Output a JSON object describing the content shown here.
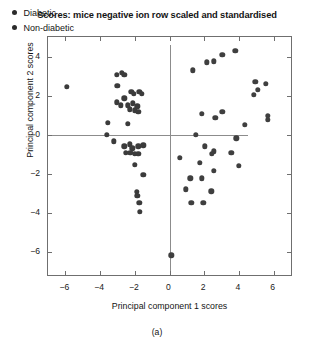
{
  "chart_data": {
    "type": "scatter",
    "title": "Scores: mice negative ion row scaled and standardised",
    "xlabel": "Principal component 1 scores",
    "ylabel": "Principal component 2 scores",
    "caption": "(a)",
    "xlim": [
      -7.0,
      7.0
    ],
    "ylim": [
      -7.2,
      5.0
    ],
    "xticks": [
      -6,
      -4,
      -2,
      0,
      2,
      4,
      6
    ],
    "xticklabels": [
      "−6",
      "−4",
      "−2",
      "0",
      "2",
      "4",
      "6"
    ],
    "yticks": [
      4,
      2,
      0,
      -2,
      -4,
      -6
    ],
    "yticklabels": [
      "4",
      "2",
      "0",
      "−2",
      "−4",
      "−6"
    ],
    "grid": false,
    "reference_lines": {
      "horizontal_y": 0,
      "vertical_x": 0,
      "color": "#8c8c8c"
    },
    "legend": {
      "position": "upper-left",
      "entries": [
        {
          "label": "Diabetic",
          "marker": "filled-circle",
          "color": "#2b2b2b"
        },
        {
          "label": "Non-diabetic",
          "marker": "filled-circle",
          "color": "#2b2b2b"
        }
      ]
    },
    "series": [
      {
        "name": "Diabetic",
        "color": "#3b3b3b",
        "marker": "filled-circle",
        "points": [
          [
            -5.9,
            2.45
          ],
          [
            -3.05,
            3.05
          ],
          [
            -2.75,
            3.15
          ],
          [
            -2.6,
            3.05
          ],
          [
            -3.0,
            2.5
          ],
          [
            -2.2,
            2.2
          ],
          [
            -2.05,
            2.1
          ],
          [
            -1.75,
            2.2
          ],
          [
            -1.6,
            2.1
          ],
          [
            -3.05,
            1.65
          ],
          [
            -2.8,
            1.5
          ],
          [
            -2.6,
            1.85
          ],
          [
            -2.4,
            1.5
          ],
          [
            -2.3,
            1.3
          ],
          [
            -2.1,
            1.6
          ],
          [
            -2.0,
            1.25
          ],
          [
            -1.85,
            1.45
          ],
          [
            -1.8,
            1.15
          ],
          [
            -3.55,
            0.6
          ],
          [
            -2.4,
            0.55
          ],
          [
            -3.6,
            0.0
          ],
          [
            -3.2,
            -0.35
          ],
          [
            -2.6,
            -0.6
          ],
          [
            -2.3,
            -0.5
          ],
          [
            -2.15,
            -0.7
          ],
          [
            -1.8,
            -0.6
          ],
          [
            -1.5,
            -0.55
          ],
          [
            -2.5,
            -0.95
          ],
          [
            -2.25,
            -0.95
          ],
          [
            -2.0,
            -1.0
          ],
          [
            -1.8,
            -1.0
          ],
          [
            -2.0,
            -1.55
          ],
          [
            -1.5,
            -2.05
          ],
          [
            -1.9,
            -2.95
          ],
          [
            -1.85,
            -3.15
          ],
          [
            -1.75,
            -3.5
          ],
          [
            -1.7,
            -3.95
          ]
        ]
      },
      {
        "name": "Non-diabetic",
        "color": "#3f3f3f",
        "marker": "filled-circle",
        "points": [
          [
            3.05,
            4.1
          ],
          [
            3.8,
            4.3
          ],
          [
            2.15,
            3.7
          ],
          [
            2.55,
            3.75
          ],
          [
            1.35,
            3.3
          ],
          [
            4.95,
            2.7
          ],
          [
            5.55,
            2.6
          ],
          [
            5.1,
            2.3
          ],
          [
            4.85,
            2.05
          ],
          [
            1.85,
            1.05
          ],
          [
            3.05,
            1.15
          ],
          [
            5.65,
            0.95
          ],
          [
            5.65,
            0.75
          ],
          [
            2.65,
            0.85
          ],
          [
            4.35,
            0.5
          ],
          [
            1.5,
            0.0
          ],
          [
            3.85,
            -0.2
          ],
          [
            2.05,
            -0.6
          ],
          [
            2.55,
            -0.85
          ],
          [
            2.45,
            -1.0
          ],
          [
            3.55,
            -0.95
          ],
          [
            0.6,
            -1.2
          ],
          [
            1.75,
            -1.45
          ],
          [
            2.55,
            -1.85
          ],
          [
            4.0,
            -1.6
          ],
          [
            1.2,
            -2.25
          ],
          [
            1.85,
            -2.25
          ],
          [
            0.95,
            -2.8
          ],
          [
            2.4,
            -2.9
          ],
          [
            1.25,
            -3.5
          ],
          [
            1.95,
            -3.5
          ],
          [
            0.1,
            -6.2
          ]
        ]
      }
    ]
  }
}
